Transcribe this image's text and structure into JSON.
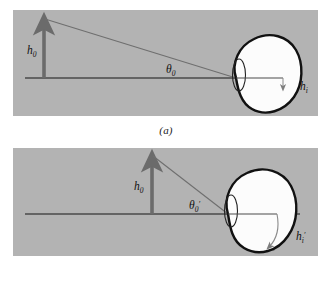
{
  "figure": {
    "background_color": "#ffffff",
    "panel_color": "#b3b3b3",
    "line_color": "#4a4a4a",
    "arrow_color": "#6b6b6b",
    "eye_fill": "#fcfcfc",
    "eye_stroke": "#111111"
  },
  "panels": [
    {
      "id": "a",
      "caption": "(a)",
      "labels": {
        "object_height": "h",
        "object_height_sub": "0",
        "object_height_prime": "",
        "angle": "θ",
        "angle_sub": "0",
        "angle_prime": "",
        "image_height": "h",
        "image_height_sub": "i",
        "image_height_prime": ""
      }
    },
    {
      "id": "b",
      "caption": "(b)",
      "labels": {
        "object_height": "h",
        "object_height_sub": "0",
        "object_height_prime": "",
        "angle": "θ",
        "angle_sub": "0",
        "angle_prime": "′",
        "image_height": "h",
        "image_height_sub": "i",
        "image_height_prime": "′"
      }
    }
  ]
}
